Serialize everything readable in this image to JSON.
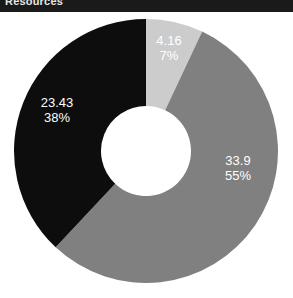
{
  "header": {
    "title": "Resources"
  },
  "chart_data": {
    "type": "pie",
    "variant": "donut",
    "title": "Resources",
    "xlabel": "",
    "ylabel": "",
    "legend": "none",
    "grid": false,
    "start_angle_deg": 0,
    "direction": "clockwise",
    "inner_radius_ratio": 0.34,
    "center": {
      "x": 146,
      "y": 151
    },
    "outer_radius": 132,
    "inner_radius": 45,
    "hole_color": "#ffffff",
    "background": "#ffffff",
    "categories": [
      "4.16",
      "33.9",
      "23.43"
    ],
    "values": [
      4.16,
      33.9,
      23.43
    ],
    "percentages": [
      7,
      55,
      38
    ],
    "colors": [
      "#cccccc",
      "#808080",
      "#0d0d0d"
    ],
    "slices": [
      {
        "name": "slice-light-gray",
        "value": "4.16",
        "percent": "7%",
        "value_number": 4.16,
        "percent_number": 7,
        "color": "#cccccc"
      },
      {
        "name": "slice-medium-gray",
        "value": "33.9",
        "percent": "55%",
        "value_number": 33.9,
        "percent_number": 55,
        "color": "#808080"
      },
      {
        "name": "slice-black",
        "value": "23.43",
        "percent": "38%",
        "value_number": 23.43,
        "percent_number": 38,
        "color": "#0d0d0d"
      }
    ]
  }
}
